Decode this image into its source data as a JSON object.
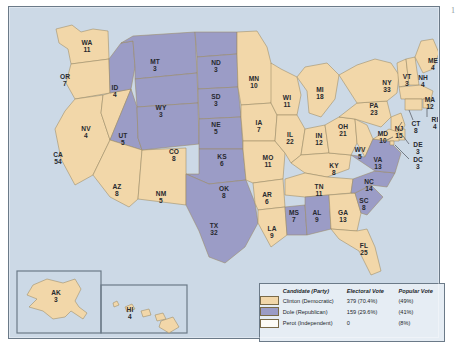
{
  "page_mark": "1",
  "legend": {
    "headers": {
      "candidate": "Candidate (Party)",
      "electoral": "Electoral Vote",
      "popular": "Popular Vote"
    },
    "rows": [
      {
        "swatch": "dem",
        "name": "Clinton (Democratic)",
        "electoral": "379 (70.4%)",
        "popular": "(49%)"
      },
      {
        "swatch": "rep",
        "name": "Dole (Republican)",
        "electoral": "159 (29.6%)",
        "popular": "(41%)"
      },
      {
        "swatch": "perot",
        "name": "Perot (Independent)",
        "electoral": "0",
        "popular": "(8%)"
      }
    ]
  },
  "colors": {
    "democratic": "#f2d7a9",
    "republican": "#9b9cc6",
    "ocean": "#ccd9e6",
    "frame": "#6b7a88",
    "state_border": "#9b8a63",
    "label": "#27292e"
  },
  "chart_data": {
    "type": "map",
    "value_label": "Electoral votes",
    "categories": [
      "AL",
      "AK",
      "AZ",
      "AR",
      "CA",
      "CO",
      "CT",
      "DE",
      "DC",
      "FL",
      "GA",
      "HI",
      "ID",
      "IL",
      "IN",
      "IA",
      "KS",
      "KY",
      "LA",
      "ME",
      "MD",
      "MA",
      "MI",
      "MN",
      "MS",
      "MO",
      "MT",
      "NE",
      "NV",
      "NH",
      "NJ",
      "NM",
      "NY",
      "NC",
      "ND",
      "OH",
      "OK",
      "OR",
      "PA",
      "RI",
      "SC",
      "SD",
      "TN",
      "TX",
      "UT",
      "VT",
      "VA",
      "WA",
      "WV",
      "WI",
      "WY"
    ],
    "values": [
      9,
      3,
      8,
      6,
      54,
      8,
      8,
      3,
      3,
      25,
      13,
      4,
      4,
      22,
      12,
      7,
      6,
      8,
      9,
      4,
      10,
      12,
      18,
      10,
      7,
      11,
      3,
      5,
      4,
      4,
      15,
      5,
      33,
      14,
      3,
      21,
      8,
      7,
      23,
      4,
      8,
      3,
      11,
      32,
      5,
      3,
      13,
      11,
      5,
      11,
      3
    ],
    "legend": [
      "Clinton (Democratic)",
      "Dole (Republican)",
      "Perot (Independent)"
    ]
  },
  "states": [
    {
      "id": "WA",
      "name": "WA",
      "ev": "11",
      "party": "dem",
      "lx": 78,
      "ly": 38
    },
    {
      "id": "OR",
      "name": "OR",
      "ev": "7",
      "party": "dem",
      "lx": 56,
      "ly": 72
    },
    {
      "id": "CA",
      "name": "CA",
      "ev": "54",
      "party": "dem",
      "lx": 49,
      "ly": 150
    },
    {
      "id": "NV",
      "name": "NV",
      "ev": "4",
      "party": "dem",
      "lx": 77,
      "ly": 124
    },
    {
      "id": "ID",
      "name": "ID",
      "ev": "4",
      "party": "rep",
      "lx": 106,
      "ly": 83
    },
    {
      "id": "MT",
      "name": "MT",
      "ev": "3",
      "party": "rep",
      "lx": 146,
      "ly": 57
    },
    {
      "id": "WY",
      "name": "WY",
      "ev": "3",
      "party": "rep",
      "lx": 152,
      "ly": 103
    },
    {
      "id": "UT",
      "name": "UT",
      "ev": "5",
      "party": "rep",
      "lx": 114,
      "ly": 131
    },
    {
      "id": "AZ",
      "name": "AZ",
      "ev": "8",
      "party": "dem",
      "lx": 108,
      "ly": 182
    },
    {
      "id": "NM",
      "name": "NM",
      "ev": "5",
      "party": "dem",
      "lx": 152,
      "ly": 189
    },
    {
      "id": "CO",
      "name": "CO",
      "ev": "8",
      "party": "rep",
      "lx": 165,
      "ly": 147
    },
    {
      "id": "ND",
      "name": "ND",
      "ev": "3",
      "party": "rep",
      "lx": 207,
      "ly": 58
    },
    {
      "id": "SD",
      "name": "SD",
      "ev": "3",
      "party": "rep",
      "lx": 207,
      "ly": 92
    },
    {
      "id": "NE",
      "name": "NE",
      "ev": "5",
      "party": "rep",
      "lx": 207,
      "ly": 120
    },
    {
      "id": "KS",
      "name": "KS",
      "ev": "6",
      "party": "rep",
      "lx": 213,
      "ly": 152
    },
    {
      "id": "OK",
      "name": "OK",
      "ev": "8",
      "party": "rep",
      "lx": 215,
      "ly": 184
    },
    {
      "id": "TX",
      "name": "TX",
      "ev": "32",
      "party": "rep",
      "lx": 205,
      "ly": 221
    },
    {
      "id": "MN",
      "name": "MN",
      "ev": "10",
      "party": "dem",
      "lx": 245,
      "ly": 74
    },
    {
      "id": "IA",
      "name": "IA",
      "ev": "7",
      "party": "dem",
      "lx": 250,
      "ly": 118
    },
    {
      "id": "MO",
      "name": "MO",
      "ev": "11",
      "party": "dem",
      "lx": 259,
      "ly": 153
    },
    {
      "id": "AR",
      "name": "AR",
      "ev": "6",
      "party": "dem",
      "lx": 258,
      "ly": 190
    },
    {
      "id": "LA",
      "name": "LA",
      "ev": "9",
      "party": "dem",
      "lx": 263,
      "ly": 224
    },
    {
      "id": "WI",
      "name": "WI",
      "ev": "11",
      "party": "dem",
      "lx": 278,
      "ly": 93
    },
    {
      "id": "IL",
      "name": "IL",
      "ev": "22",
      "party": "dem",
      "lx": 281,
      "ly": 130
    },
    {
      "id": "MS",
      "name": "MS",
      "ev": "7",
      "party": "rep",
      "lx": 285,
      "ly": 208
    },
    {
      "id": "MI",
      "name": "MI",
      "ev": "18",
      "party": "dem",
      "lx": 311,
      "ly": 85
    },
    {
      "id": "IN",
      "name": "IN",
      "ev": "12",
      "party": "dem",
      "lx": 310,
      "ly": 131
    },
    {
      "id": "KY",
      "name": "KY",
      "ev": "8",
      "party": "dem",
      "lx": 325,
      "ly": 161
    },
    {
      "id": "TN",
      "name": "TN",
      "ev": "11",
      "party": "dem",
      "lx": 310,
      "ly": 182
    },
    {
      "id": "AL",
      "name": "AL",
      "ev": "9",
      "party": "rep",
      "lx": 308,
      "ly": 208
    },
    {
      "id": "OH",
      "name": "OH",
      "ev": "21",
      "party": "dem",
      "lx": 334,
      "ly": 122
    },
    {
      "id": "GA",
      "name": "GA",
      "ev": "13",
      "party": "dem",
      "lx": 334,
      "ly": 208
    },
    {
      "id": "FL",
      "name": "FL",
      "ev": "25",
      "party": "dem",
      "lx": 355,
      "ly": 241
    },
    {
      "id": "SC",
      "name": "SC",
      "ev": "8",
      "party": "rep",
      "lx": 355,
      "ly": 196
    },
    {
      "id": "NC",
      "name": "NC",
      "ev": "14",
      "party": "rep",
      "lx": 360,
      "ly": 177
    },
    {
      "id": "WV",
      "name": "WV",
      "ev": "5",
      "party": "dem",
      "lx": 351,
      "ly": 145
    },
    {
      "id": "VA",
      "name": "VA",
      "ev": "13",
      "party": "rep",
      "lx": 369,
      "ly": 155
    },
    {
      "id": "PA",
      "name": "PA",
      "ev": "23",
      "party": "dem",
      "lx": 365,
      "ly": 101
    },
    {
      "id": "NY",
      "name": "NY",
      "ev": "33",
      "party": "dem",
      "lx": 378,
      "ly": 78
    },
    {
      "id": "VT",
      "name": "VT",
      "ev": "3",
      "party": "dem",
      "lx": 398,
      "ly": 72
    },
    {
      "id": "NH",
      "name": "NH",
      "ev": "4",
      "party": "dem",
      "lx": 414,
      "ly": 73
    },
    {
      "id": "ME",
      "name": "ME",
      "ev": "4",
      "party": "dem",
      "lx": 424,
      "ly": 56
    },
    {
      "id": "MA",
      "name": "MA",
      "ev": "12",
      "party": "dem",
      "lx": 421,
      "ly": 95
    },
    {
      "id": "RI",
      "name": "RI",
      "ev": "4",
      "party": "dem",
      "lx": 426,
      "ly": 115
    },
    {
      "id": "CT",
      "name": "CT",
      "ev": "8",
      "party": "dem",
      "lx": 407,
      "ly": 119
    },
    {
      "id": "NJ",
      "name": "NJ",
      "ev": "15",
      "party": "dem",
      "lx": 390,
      "ly": 124
    },
    {
      "id": "MD",
      "name": "MD",
      "ev": "10",
      "party": "dem",
      "lx": 374,
      "ly": 129
    },
    {
      "id": "DE",
      "name": "DE",
      "ev": "3",
      "party": "dem",
      "lx": 409,
      "ly": 140
    },
    {
      "id": "DC",
      "name": "DC",
      "ev": "3",
      "party": "dem",
      "lx": 409,
      "ly": 155
    },
    {
      "id": "AK",
      "name": "AK",
      "ev": "3",
      "party": "dem",
      "lx": 47,
      "ly": 288
    },
    {
      "id": "HI",
      "name": "HI",
      "ev": "4",
      "party": "dem",
      "lx": 121,
      "ly": 305
    }
  ]
}
